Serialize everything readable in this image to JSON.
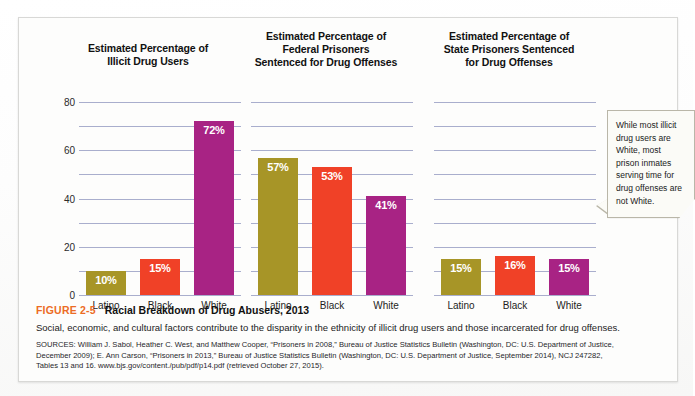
{
  "figure": {
    "number_label": "FIGURE 2-5",
    "title": "Racial Breakdown of Drug Abusers, 2013",
    "description": "Social, economic, and cultural factors contribute to the disparity in the ethnicity of illicit drug users and those incarcerated for drug offenses.",
    "sources_line1": "SOURCES: William J. Sabol, Heather C. West, and Matthew Cooper, “Prisoners in 2008,” Bureau of Justice Statistics Bulletin (Washington, DC: U.S. Department of Justice,",
    "sources_line2": "December 2009); E. Ann Carson, “Prisoners in 2013,” Bureau of Justice Statistics Bulletin (Washington, DC: U.S. Department of Justice, September 2014), NCJ 247282,",
    "sources_line3": "Tables 13 and 16. www.bjs.gov/content./pub/pdf/p14.pdf (retrieved October 27, 2015)."
  },
  "callout": {
    "text": "While most illicit drug users are White, most prison inmates serving time for drug offenses are not White."
  },
  "colors": {
    "latino": "#a79527",
    "black": "#f04127",
    "white": "#a82384",
    "gridline": "#a9aecd",
    "figure_number": "#ec6c25",
    "axis_text": "#2b2b2b"
  },
  "chart_data": [
    {
      "type": "bar",
      "title": "Estimated Percentage of Illicit Drug Users",
      "title_lines": [
        "Estimated Percentage of",
        "Illicit Drug Users"
      ],
      "categories": [
        "Latino",
        "Black",
        "White"
      ],
      "values": [
        10,
        15,
        72
      ],
      "value_labels": [
        "10%",
        "15%",
        "72%"
      ],
      "bar_colors": [
        "#a79527",
        "#f04127",
        "#a82384"
      ],
      "xlabel": "",
      "ylabel": "",
      "ylim": [
        0,
        85
      ],
      "yticks": [
        0,
        20,
        40,
        60,
        80
      ],
      "ytick_labels": [
        "0",
        "20",
        "40",
        "60",
        "80"
      ],
      "minor_ticks": [
        10,
        30,
        50,
        70
      ],
      "grid": true,
      "show_yaxis": true,
      "legend": "none"
    },
    {
      "type": "bar",
      "title": "Estimated Percentage of Federal Prisoners Sentenced for Drug Offenses",
      "title_lines": [
        "Estimated Percentage of",
        "Federal Prisoners",
        "Sentenced for Drug Offenses"
      ],
      "categories": [
        "Latino",
        "Black",
        "White"
      ],
      "values": [
        57,
        53,
        41
      ],
      "value_labels": [
        "57%",
        "53%",
        "41%"
      ],
      "bar_colors": [
        "#a79527",
        "#f04127",
        "#a82384"
      ],
      "xlabel": "",
      "ylabel": "",
      "ylim": [
        0,
        85
      ],
      "yticks": [
        0,
        20,
        40,
        60,
        80
      ],
      "ytick_labels": [
        "0",
        "20",
        "40",
        "60",
        "80"
      ],
      "minor_ticks": [
        10,
        30,
        50,
        70
      ],
      "grid": true,
      "show_yaxis": false,
      "legend": "none"
    },
    {
      "type": "bar",
      "title": "Estimated Percentage of State Prisoners Sentenced for Drug Offenses",
      "title_lines": [
        "Estimated Percentage of",
        "State Prisoners Sentenced",
        "for Drug Offenses"
      ],
      "categories": [
        "Latino",
        "Black",
        "White"
      ],
      "values": [
        15,
        16,
        15
      ],
      "value_labels": [
        "15%",
        "16%",
        "15%"
      ],
      "bar_colors": [
        "#a79527",
        "#f04127",
        "#a82384"
      ],
      "xlabel": "",
      "ylabel": "",
      "ylim": [
        0,
        85
      ],
      "yticks": [
        0,
        20,
        40,
        60,
        80
      ],
      "ytick_labels": [
        "0",
        "20",
        "40",
        "60",
        "80"
      ],
      "minor_ticks": [
        10,
        30,
        50,
        70
      ],
      "grid": true,
      "show_yaxis": false,
      "legend": "none"
    }
  ]
}
